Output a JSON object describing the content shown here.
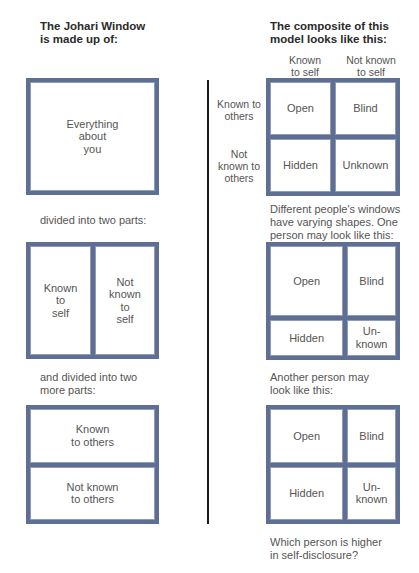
{
  "left_column": {
    "heading": "The Johari Window\nis made up of:",
    "box_whole": {
      "label": "Everything\nabout\nyou"
    },
    "caption_two_parts": "divided into two parts:",
    "box_self": {
      "panes": [
        "Known\nto\nself",
        "Not\nknown\nto\nself"
      ]
    },
    "caption_more_parts": "and divided into two\nmore parts:",
    "box_others": {
      "panes": [
        "Known\nto others",
        "Not known\nto others"
      ]
    }
  },
  "right_column": {
    "heading": "The composite of this\nmodel looks like this:",
    "column_labels": [
      "Known\nto self",
      "Not known\nto self"
    ],
    "row_labels": [
      "Known to\nothers",
      "Not\nknown to\nothers"
    ],
    "composite": {
      "panes": [
        "Open",
        "Blind",
        "Hidden",
        "Unknown"
      ]
    },
    "caption_varying": "Different people's windows\nhave varying shapes. One\nperson may look like this:",
    "person_one": {
      "panes": [
        "Open",
        "Blind",
        "Hidden",
        "Un-\nknown"
      ],
      "open_rows_share": 0.66,
      "self_cols_share": 0.6
    },
    "caption_another": "Another person may\nlook like this:",
    "person_two": {
      "panes": [
        "Open",
        "Blind",
        "Hidden",
        "Un-\nknown"
      ],
      "open_rows_share": 0.5,
      "self_cols_share": 0.6
    },
    "question": "Which person is higher\nin self-disclosure?"
  },
  "colors": {
    "frame": "#5e6f93",
    "divider": "#1a1a1a",
    "text": "#555555"
  }
}
